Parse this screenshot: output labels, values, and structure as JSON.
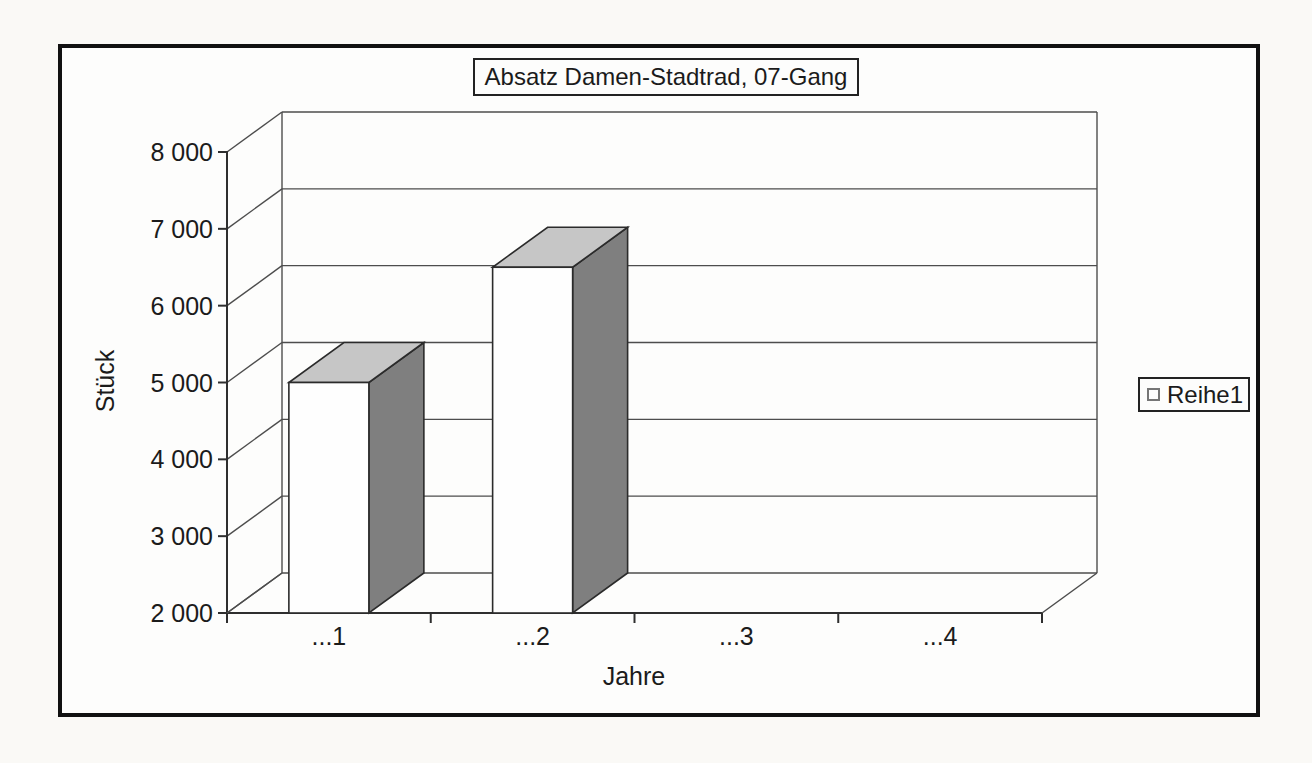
{
  "colors": {
    "paper": "#faf9f6",
    "chart_background": "#fdfdfc",
    "frame_border": "#111111",
    "border_box": "#222222",
    "axis_line": "#2e2e2e",
    "grid_line": "#4d4d4d",
    "text": "#1b1b1b",
    "bar_front": "#fefefe",
    "bar_top": "#c6c6c6",
    "bar_side": "#7f7f7f",
    "bar_outline": "#2b2b2b",
    "legend_marker_border": "#767676"
  },
  "chart_data": {
    "type": "bar",
    "projection": "3d",
    "title": "Absatz Damen-Stadtrad, 07-Gang",
    "xlabel": "Jahre",
    "ylabel": "Stück",
    "categories": [
      "...1",
      "...2",
      "...3",
      "...4"
    ],
    "series": [
      {
        "name": "Reihe1",
        "values": [
          5000,
          6500,
          null,
          null
        ]
      }
    ],
    "ylim": [
      2000,
      8000
    ],
    "yticks": [
      {
        "value": 2000,
        "label": "2 000"
      },
      {
        "value": 3000,
        "label": "3 000"
      },
      {
        "value": 4000,
        "label": "4 000"
      },
      {
        "value": 5000,
        "label": "5 000"
      },
      {
        "value": 6000,
        "label": "6 000"
      },
      {
        "value": 7000,
        "label": "7 000"
      },
      {
        "value": 8000,
        "label": "8 000"
      }
    ],
    "grid": true,
    "legend_position": "right"
  }
}
